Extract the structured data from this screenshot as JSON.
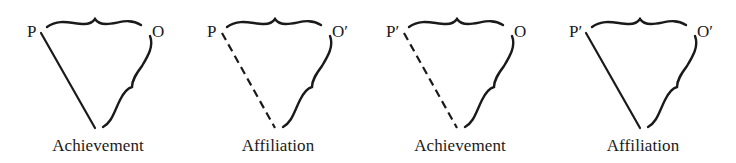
{
  "figure": {
    "colors": {
      "ink": "#1a1a1a",
      "background": "#ffffff"
    },
    "panels": [
      {
        "left_label": "P",
        "right_label": "O",
        "caption": "Achievement",
        "link_style": "solid"
      },
      {
        "left_label": "P",
        "right_label": "O′",
        "caption": "Affiliation",
        "link_style": "dashed"
      },
      {
        "left_label": "P′",
        "right_label": "O",
        "caption": "Achievement",
        "link_style": "dashed"
      },
      {
        "left_label": "P′",
        "right_label": "O′",
        "caption": "Affiliation",
        "link_style": "solid"
      }
    ]
  }
}
